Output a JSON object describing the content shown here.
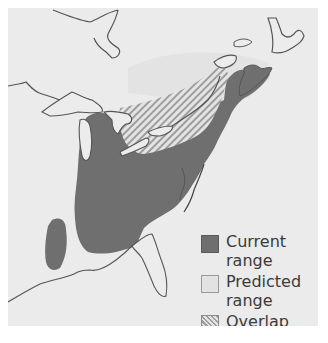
{
  "map": {
    "title": "",
    "region": "Eastern North America",
    "colors": {
      "background": "#ebebeb",
      "land_outline": "#555555",
      "water": "#f2f2f2",
      "current_range": "#6f6f6f",
      "predicted_range": "#e2e2e2",
      "overlap_stripe": "#9c9c9c"
    }
  },
  "legend": {
    "items": [
      {
        "key": "current",
        "label_line1": "Current",
        "label_line2": "range"
      },
      {
        "key": "predicted",
        "label_line1": "Predicted",
        "label_line2": "range"
      },
      {
        "key": "overlap",
        "label_line1": "Overlap",
        "label_line2": ""
      }
    ]
  }
}
